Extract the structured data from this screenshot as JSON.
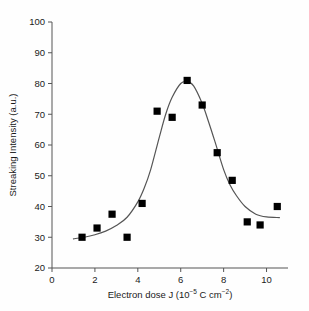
{
  "chart_data": {
    "type": "scatter",
    "title": "",
    "xlabel": "Electron dose J (10-5 C cm-2)",
    "xlabel_parts": {
      "main": "Electron dose J (10",
      "exp1": "−5",
      "mid": " C cm",
      "exp2": "−2",
      "close": ")"
    },
    "ylabel": "Streaking Intensity (a.u.)",
    "xlim": [
      0,
      11
    ],
    "ylim": [
      20,
      100
    ],
    "xticks": [
      0,
      2,
      4,
      6,
      8,
      10
    ],
    "yticks": [
      20,
      30,
      40,
      50,
      60,
      70,
      80,
      90,
      100
    ],
    "xtick_labels": [
      "0",
      "2",
      "4",
      "6",
      "8",
      "10"
    ],
    "ytick_labels": [
      "20",
      "30",
      "40",
      "50",
      "60",
      "70",
      "80",
      "90",
      "100"
    ],
    "grid": false,
    "legend": null,
    "marker": "square",
    "marker_color": "#000000",
    "line_color": "#555555",
    "axis_color": "#555555",
    "series": [
      {
        "name": "Streaking intensity data",
        "marker": "filled-square",
        "x": [
          1.4,
          2.1,
          2.8,
          3.5,
          4.2,
          4.9,
          5.6,
          6.3,
          7.0,
          7.7,
          8.4,
          9.1,
          9.7,
          10.5
        ],
        "y": [
          30.0,
          33.0,
          37.5,
          30.0,
          41.0,
          71.0,
          69.0,
          81.0,
          73.0,
          57.5,
          48.5,
          35.0,
          34.0,
          40.0
        ]
      },
      {
        "name": "Fitted curve",
        "type": "line",
        "x": [
          1.0,
          1.5,
          2.0,
          2.5,
          3.0,
          3.5,
          4.0,
          4.3,
          4.6,
          5.0,
          5.3,
          5.6,
          6.0,
          6.3,
          6.6,
          7.0,
          7.3,
          7.6,
          8.0,
          8.3,
          8.6,
          9.0,
          9.5,
          10.0,
          10.6
        ],
        "y": [
          29.5,
          30.0,
          30.8,
          32.0,
          33.8,
          36.5,
          41.5,
          46.0,
          52.0,
          62.5,
          70.0,
          75.5,
          80.0,
          80.6,
          79.2,
          73.5,
          67.5,
          61.0,
          52.0,
          47.0,
          43.5,
          40.0,
          37.5,
          36.6,
          36.4
        ]
      }
    ]
  },
  "figure": {
    "background": "#fefefe",
    "plot_background": "#ffffff"
  }
}
